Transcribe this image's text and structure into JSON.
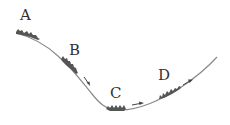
{
  "diagram": {
    "type": "slope-track",
    "colors": {
      "track": "#8a8a8a",
      "patch": "#555555",
      "label": "#333333",
      "arrow": "#444444"
    },
    "points": [
      {
        "id": "A",
        "label": "A"
      },
      {
        "id": "B",
        "label": "B"
      },
      {
        "id": "C",
        "label": "C"
      },
      {
        "id": "D",
        "label": "D"
      }
    ]
  }
}
